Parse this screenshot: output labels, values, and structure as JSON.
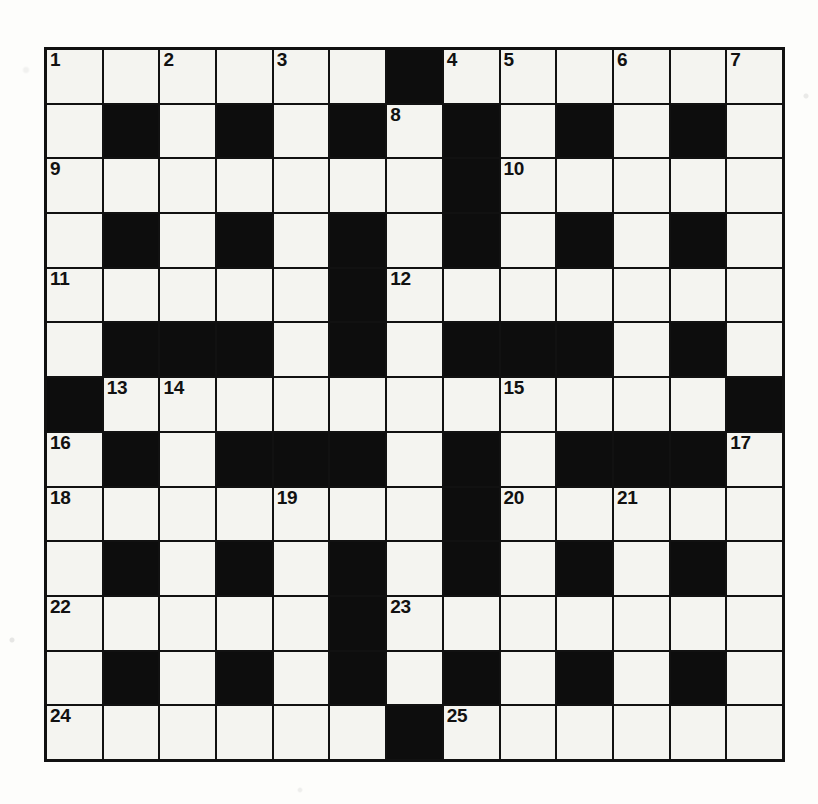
{
  "puzzle": {
    "kind": "crossword-grid",
    "rows": 13,
    "columns": 13,
    "colors": {
      "block": "#0d0d0d",
      "open": "#f4f4f0",
      "rule": "#111111",
      "paper": "#fdfdfb",
      "number": "#111111"
    },
    "numbers_present": [
      "1",
      "2",
      "3",
      "4",
      "5",
      "6",
      "7",
      "8",
      "9",
      "10",
      "11",
      "12",
      "13",
      "14",
      "15",
      "16",
      "17",
      "18",
      "19",
      "20",
      "21",
      "22",
      "23",
      "24",
      "25"
    ],
    "max_number": 25,
    "counts": {
      "open_cells": 107,
      "block_cells": 62,
      "numbered_cells": 25
    },
    "grid": [
      [
        {
          "t": "open",
          "n": "1"
        },
        {
          "t": "open",
          "n": ""
        },
        {
          "t": "open",
          "n": "2"
        },
        {
          "t": "open",
          "n": ""
        },
        {
          "t": "open",
          "n": "3"
        },
        {
          "t": "open",
          "n": ""
        },
        {
          "t": "block",
          "n": ""
        },
        {
          "t": "open",
          "n": "4"
        },
        {
          "t": "open",
          "n": "5"
        },
        {
          "t": "open",
          "n": ""
        },
        {
          "t": "open",
          "n": "6"
        },
        {
          "t": "open",
          "n": ""
        },
        {
          "t": "open",
          "n": "7"
        }
      ],
      [
        {
          "t": "open",
          "n": ""
        },
        {
          "t": "block",
          "n": ""
        },
        {
          "t": "open",
          "n": ""
        },
        {
          "t": "block",
          "n": ""
        },
        {
          "t": "open",
          "n": ""
        },
        {
          "t": "block",
          "n": ""
        },
        {
          "t": "open",
          "n": "8"
        },
        {
          "t": "block",
          "n": ""
        },
        {
          "t": "open",
          "n": ""
        },
        {
          "t": "block",
          "n": ""
        },
        {
          "t": "open",
          "n": ""
        },
        {
          "t": "block",
          "n": ""
        },
        {
          "t": "open",
          "n": ""
        }
      ],
      [
        {
          "t": "open",
          "n": "9"
        },
        {
          "t": "open",
          "n": ""
        },
        {
          "t": "open",
          "n": ""
        },
        {
          "t": "open",
          "n": ""
        },
        {
          "t": "open",
          "n": ""
        },
        {
          "t": "open",
          "n": ""
        },
        {
          "t": "open",
          "n": ""
        },
        {
          "t": "block",
          "n": ""
        },
        {
          "t": "open",
          "n": "10"
        },
        {
          "t": "open",
          "n": ""
        },
        {
          "t": "open",
          "n": ""
        },
        {
          "t": "open",
          "n": ""
        },
        {
          "t": "open",
          "n": ""
        }
      ],
      [
        {
          "t": "open",
          "n": ""
        },
        {
          "t": "block",
          "n": ""
        },
        {
          "t": "open",
          "n": ""
        },
        {
          "t": "block",
          "n": ""
        },
        {
          "t": "open",
          "n": ""
        },
        {
          "t": "block",
          "n": ""
        },
        {
          "t": "open",
          "n": ""
        },
        {
          "t": "block",
          "n": ""
        },
        {
          "t": "open",
          "n": ""
        },
        {
          "t": "block",
          "n": ""
        },
        {
          "t": "open",
          "n": ""
        },
        {
          "t": "block",
          "n": ""
        },
        {
          "t": "open",
          "n": ""
        }
      ],
      [
        {
          "t": "open",
          "n": "11"
        },
        {
          "t": "open",
          "n": ""
        },
        {
          "t": "open",
          "n": ""
        },
        {
          "t": "open",
          "n": ""
        },
        {
          "t": "open",
          "n": ""
        },
        {
          "t": "block",
          "n": ""
        },
        {
          "t": "open",
          "n": "12"
        },
        {
          "t": "open",
          "n": ""
        },
        {
          "t": "open",
          "n": ""
        },
        {
          "t": "open",
          "n": ""
        },
        {
          "t": "open",
          "n": ""
        },
        {
          "t": "open",
          "n": ""
        },
        {
          "t": "open",
          "n": ""
        }
      ],
      [
        {
          "t": "open",
          "n": ""
        },
        {
          "t": "block",
          "n": ""
        },
        {
          "t": "block",
          "n": ""
        },
        {
          "t": "block",
          "n": ""
        },
        {
          "t": "open",
          "n": ""
        },
        {
          "t": "block",
          "n": ""
        },
        {
          "t": "open",
          "n": ""
        },
        {
          "t": "block",
          "n": ""
        },
        {
          "t": "block",
          "n": ""
        },
        {
          "t": "block",
          "n": ""
        },
        {
          "t": "open",
          "n": ""
        },
        {
          "t": "block",
          "n": ""
        },
        {
          "t": "open",
          "n": ""
        }
      ],
      [
        {
          "t": "block",
          "n": ""
        },
        {
          "t": "open",
          "n": "13"
        },
        {
          "t": "open",
          "n": "14"
        },
        {
          "t": "open",
          "n": ""
        },
        {
          "t": "open",
          "n": ""
        },
        {
          "t": "open",
          "n": ""
        },
        {
          "t": "open",
          "n": ""
        },
        {
          "t": "open",
          "n": ""
        },
        {
          "t": "open",
          "n": "15"
        },
        {
          "t": "open",
          "n": ""
        },
        {
          "t": "open",
          "n": ""
        },
        {
          "t": "open",
          "n": ""
        },
        {
          "t": "block",
          "n": ""
        }
      ],
      [
        {
          "t": "open",
          "n": "16"
        },
        {
          "t": "block",
          "n": ""
        },
        {
          "t": "open",
          "n": ""
        },
        {
          "t": "block",
          "n": ""
        },
        {
          "t": "block",
          "n": ""
        },
        {
          "t": "block",
          "n": ""
        },
        {
          "t": "open",
          "n": ""
        },
        {
          "t": "block",
          "n": ""
        },
        {
          "t": "open",
          "n": ""
        },
        {
          "t": "block",
          "n": ""
        },
        {
          "t": "block",
          "n": ""
        },
        {
          "t": "block",
          "n": ""
        },
        {
          "t": "open",
          "n": "17"
        }
      ],
      [
        {
          "t": "open",
          "n": "18"
        },
        {
          "t": "open",
          "n": ""
        },
        {
          "t": "open",
          "n": ""
        },
        {
          "t": "open",
          "n": ""
        },
        {
          "t": "open",
          "n": "19"
        },
        {
          "t": "open",
          "n": ""
        },
        {
          "t": "open",
          "n": ""
        },
        {
          "t": "block",
          "n": ""
        },
        {
          "t": "open",
          "n": "20"
        },
        {
          "t": "open",
          "n": ""
        },
        {
          "t": "open",
          "n": "21"
        },
        {
          "t": "open",
          "n": ""
        },
        {
          "t": "open",
          "n": ""
        }
      ],
      [
        {
          "t": "open",
          "n": ""
        },
        {
          "t": "block",
          "n": ""
        },
        {
          "t": "open",
          "n": ""
        },
        {
          "t": "block",
          "n": ""
        },
        {
          "t": "open",
          "n": ""
        },
        {
          "t": "block",
          "n": ""
        },
        {
          "t": "open",
          "n": ""
        },
        {
          "t": "block",
          "n": ""
        },
        {
          "t": "open",
          "n": ""
        },
        {
          "t": "block",
          "n": ""
        },
        {
          "t": "open",
          "n": ""
        },
        {
          "t": "block",
          "n": ""
        },
        {
          "t": "open",
          "n": ""
        }
      ],
      [
        {
          "t": "open",
          "n": "22"
        },
        {
          "t": "open",
          "n": ""
        },
        {
          "t": "open",
          "n": ""
        },
        {
          "t": "open",
          "n": ""
        },
        {
          "t": "open",
          "n": ""
        },
        {
          "t": "block",
          "n": ""
        },
        {
          "t": "open",
          "n": "23"
        },
        {
          "t": "open",
          "n": ""
        },
        {
          "t": "open",
          "n": ""
        },
        {
          "t": "open",
          "n": ""
        },
        {
          "t": "open",
          "n": ""
        },
        {
          "t": "open",
          "n": ""
        },
        {
          "t": "open",
          "n": ""
        }
      ],
      [
        {
          "t": "open",
          "n": ""
        },
        {
          "t": "block",
          "n": ""
        },
        {
          "t": "open",
          "n": ""
        },
        {
          "t": "block",
          "n": ""
        },
        {
          "t": "open",
          "n": ""
        },
        {
          "t": "block",
          "n": ""
        },
        {
          "t": "open",
          "n": ""
        },
        {
          "t": "block",
          "n": ""
        },
        {
          "t": "open",
          "n": ""
        },
        {
          "t": "block",
          "n": ""
        },
        {
          "t": "open",
          "n": ""
        },
        {
          "t": "block",
          "n": ""
        },
        {
          "t": "open",
          "n": ""
        }
      ],
      [
        {
          "t": "open",
          "n": "24"
        },
        {
          "t": "open",
          "n": ""
        },
        {
          "t": "open",
          "n": ""
        },
        {
          "t": "open",
          "n": ""
        },
        {
          "t": "open",
          "n": ""
        },
        {
          "t": "open",
          "n": ""
        },
        {
          "t": "block",
          "n": ""
        },
        {
          "t": "open",
          "n": "25"
        },
        {
          "t": "open",
          "n": ""
        },
        {
          "t": "open",
          "n": ""
        },
        {
          "t": "open",
          "n": ""
        },
        {
          "t": "open",
          "n": ""
        },
        {
          "t": "open",
          "n": ""
        }
      ]
    ]
  }
}
